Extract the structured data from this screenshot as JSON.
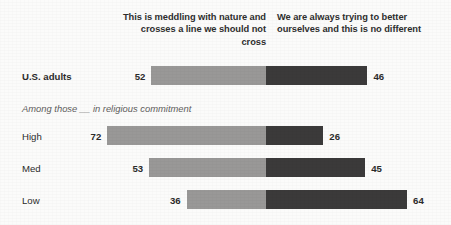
{
  "chart_data": {
    "type": "bar",
    "subtype": "diverging-stacked-bar",
    "title": "",
    "xlabel": "",
    "ylabel": "",
    "grid": false,
    "legend_position": "top",
    "axis_center_value": 0,
    "value_unit": "percent",
    "categories": [
      "U.S. adults",
      "High",
      "Med",
      "Low"
    ],
    "series": [
      {
        "name": "This is meddling with nature and crosses a line we should not cross",
        "color": "#999897",
        "side": "left",
        "values": [
          52,
          72,
          53,
          36
        ]
      },
      {
        "name": "We are always trying to better ourselves and this is no different",
        "color": "#3b3a3a",
        "side": "right",
        "values": [
          46,
          26,
          45,
          64
        ]
      }
    ]
  },
  "headers": {
    "left": "This is meddling with nature and crosses a line we should not cross",
    "right": "We are always trying to better ourselves and this is no different"
  },
  "group_note": "Among those __ in religious commitment",
  "rows": [
    {
      "label": "U.S. adults",
      "left_value": "52",
      "right_value": "46"
    },
    {
      "label": "High",
      "left_value": "72",
      "right_value": "26"
    },
    {
      "label": "Med",
      "left_value": "53",
      "right_value": "45"
    },
    {
      "label": "Low",
      "left_value": "36",
      "right_value": "64"
    }
  ]
}
